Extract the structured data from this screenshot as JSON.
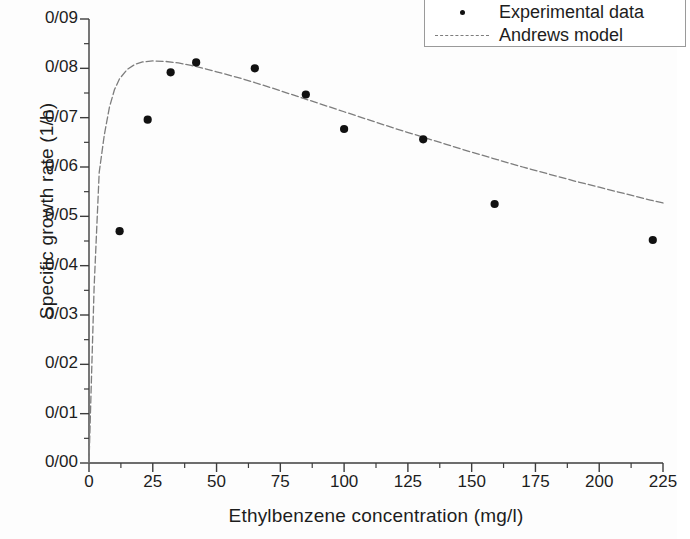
{
  "chart_data": {
    "type": "scatter",
    "title": "",
    "xlabel": "Ethylbenzene concentration (mg/l)",
    "ylabel": "Specific growth rate (1/h)",
    "xlim": [
      0,
      225
    ],
    "ylim": [
      0.0,
      0.09
    ],
    "grid": false,
    "legend_position": "top-right",
    "xticks": [
      0,
      25,
      50,
      75,
      100,
      125,
      150,
      175,
      200,
      225
    ],
    "xtick_labels": [
      "0",
      "25",
      "50",
      "75",
      "100",
      "125",
      "150",
      "175",
      "200",
      "225"
    ],
    "yticks": [
      0.0,
      0.01,
      0.02,
      0.03,
      0.04,
      0.05,
      0.06,
      0.07,
      0.08,
      0.09
    ],
    "ytick_labels": [
      "0/00",
      "0/01",
      "0/02",
      "0/03",
      "0/04",
      "0/05",
      "0/06",
      "0/07",
      "0/08",
      "0/09"
    ],
    "minor_ticks": true,
    "series": [
      {
        "name": "Experimental data",
        "kind": "scatter",
        "marker": "dot",
        "color": "#111111",
        "x": [
          12,
          23,
          32,
          42,
          65,
          85,
          100,
          131,
          159,
          221
        ],
        "y": [
          0.047,
          0.0696,
          0.0792,
          0.0812,
          0.08,
          0.0747,
          0.0677,
          0.0656,
          0.0525,
          0.0452
        ]
      },
      {
        "name": "Andrews model",
        "kind": "line",
        "style": "dashed",
        "color": "#7d7d7d",
        "model": "mu = mu_max * S / (Ks + S + S^2/Ki)",
        "params": {
          "mu_max": 0.195,
          "Ks": 8.2,
          "Ki": 280
        },
        "x": [
          0,
          2,
          4,
          6,
          8,
          10,
          12,
          15,
          18,
          21,
          25,
          30,
          35,
          40,
          45,
          50,
          60,
          70,
          80,
          90,
          100,
          110,
          120,
          130,
          140,
          150,
          160,
          170,
          180,
          190,
          200,
          210,
          220,
          225
        ],
        "y": [
          0.0,
          0.0355,
          0.0589,
          0.0665,
          0.0721,
          0.0757,
          0.0779,
          0.0798,
          0.0808,
          0.0813,
          0.0815,
          0.0814,
          0.0811,
          0.0806,
          0.08,
          0.0793,
          0.0779,
          0.0763,
          0.0746,
          0.0729,
          0.0712,
          0.0695,
          0.0678,
          0.0662,
          0.0646,
          0.063,
          0.0615,
          0.06,
          0.0586,
          0.0572,
          0.0559,
          0.0546,
          0.0533,
          0.0527
        ]
      }
    ]
  },
  "legend": {
    "items": [
      {
        "label": "Experimental data",
        "symbol": "dot-marker"
      },
      {
        "label": "Andrews model",
        "symbol": "dashed-line"
      }
    ]
  }
}
